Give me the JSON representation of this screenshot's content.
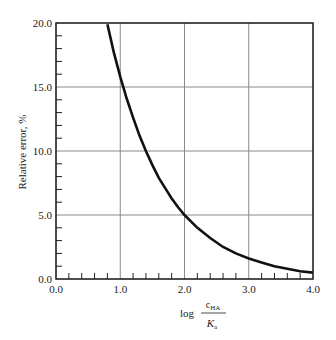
{
  "chart_data": {
    "type": "line",
    "title": "",
    "xlabel": "log c_HA / K_a",
    "xlabel_parts": {
      "prefix": "log",
      "numerator": "c",
      "numerator_sub": "HA",
      "denominator": "K",
      "denominator_sub": "a"
    },
    "ylabel": "Relative error, %",
    "xlim": [
      0.0,
      4.0
    ],
    "ylim": [
      0.0,
      20.0
    ],
    "x_ticks": [
      "0.0",
      "1.0",
      "2.0",
      "3.0",
      "4.0"
    ],
    "y_ticks": [
      "0.0",
      "5.0",
      "10.0",
      "15.0",
      "20.0"
    ],
    "x_minor_step": 0.2,
    "y_minor_step": 1.0,
    "grid": true,
    "legend": null,
    "series": [
      {
        "name": "Relative error",
        "color": "#111111",
        "x": [
          0.8,
          0.9,
          1.0,
          1.1,
          1.2,
          1.3,
          1.4,
          1.5,
          1.6,
          1.7,
          1.8,
          1.9,
          2.0,
          2.2,
          2.4,
          2.6,
          2.8,
          3.0,
          3.2,
          3.4,
          3.6,
          3.8,
          4.0
        ],
        "values": [
          19.9,
          17.7,
          15.8,
          14.1,
          12.6,
          11.2,
          10.0,
          8.9,
          7.9,
          7.1,
          6.3,
          5.6,
          5.0,
          4.0,
          3.2,
          2.5,
          2.0,
          1.6,
          1.3,
          1.0,
          0.8,
          0.6,
          0.5
        ]
      }
    ]
  }
}
